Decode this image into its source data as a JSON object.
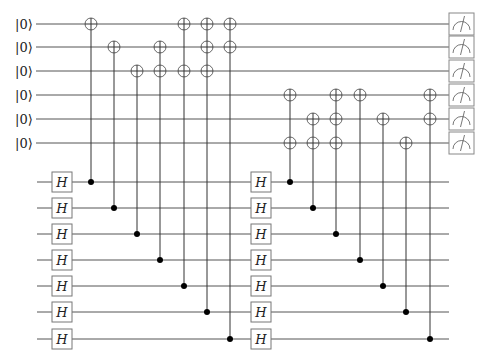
{
  "diagram": {
    "type": "quantum-circuit",
    "top_qubits": {
      "count": 6,
      "init_label": "|0⟩",
      "labels": [
        "|0⟩",
        "|0⟩",
        "|0⟩",
        "|0⟩",
        "|0⟩",
        "|0⟩"
      ],
      "y": [
        24,
        47,
        71,
        95,
        119,
        143
      ],
      "wire_start_x": 36,
      "wire_end_x": 449,
      "measurement": true
    },
    "ancilla_wires": {
      "count": 7,
      "y": [
        182,
        208,
        234,
        260,
        286,
        312,
        339
      ],
      "wire_start_x": 37,
      "wire_end_x": 449
    },
    "hadamard_gate_label": "H",
    "hadamard_columns_x": [
      62,
      261
    ],
    "blocks": [
      {
        "name": "block-1",
        "columns": [
          {
            "x": 91,
            "control": 0,
            "targets": [
              0
            ]
          },
          {
            "x": 114,
            "control": 1,
            "targets": [
              1
            ]
          },
          {
            "x": 137,
            "control": 2,
            "targets": [
              2
            ]
          },
          {
            "x": 160,
            "control": 3,
            "targets": [
              1,
              2
            ]
          },
          {
            "x": 184,
            "control": 4,
            "targets": [
              0,
              2
            ]
          },
          {
            "x": 207,
            "control": 5,
            "targets": [
              0,
              1,
              2
            ]
          },
          {
            "x": 230,
            "control": 6,
            "targets": [
              0,
              1
            ]
          }
        ]
      },
      {
        "name": "block-2",
        "columns": [
          {
            "x": 290,
            "control": 0,
            "targets": [
              3,
              5
            ]
          },
          {
            "x": 313,
            "control": 1,
            "targets": [
              4,
              5
            ]
          },
          {
            "x": 336,
            "control": 2,
            "targets": [
              3,
              4,
              5
            ]
          },
          {
            "x": 360,
            "control": 3,
            "targets": [
              3
            ]
          },
          {
            "x": 383,
            "control": 4,
            "targets": [
              4
            ]
          },
          {
            "x": 406,
            "control": 5,
            "targets": [
              5
            ]
          },
          {
            "x": 430,
            "control": 6,
            "targets": [
              3,
              4
            ]
          }
        ]
      }
    ],
    "measurement_box": {
      "x": 449,
      "width": 25,
      "height": 22
    },
    "colors": {
      "wire": "#555555",
      "control_dot": "#000000",
      "gate_border": "#777777",
      "background": "#ffffff"
    }
  }
}
